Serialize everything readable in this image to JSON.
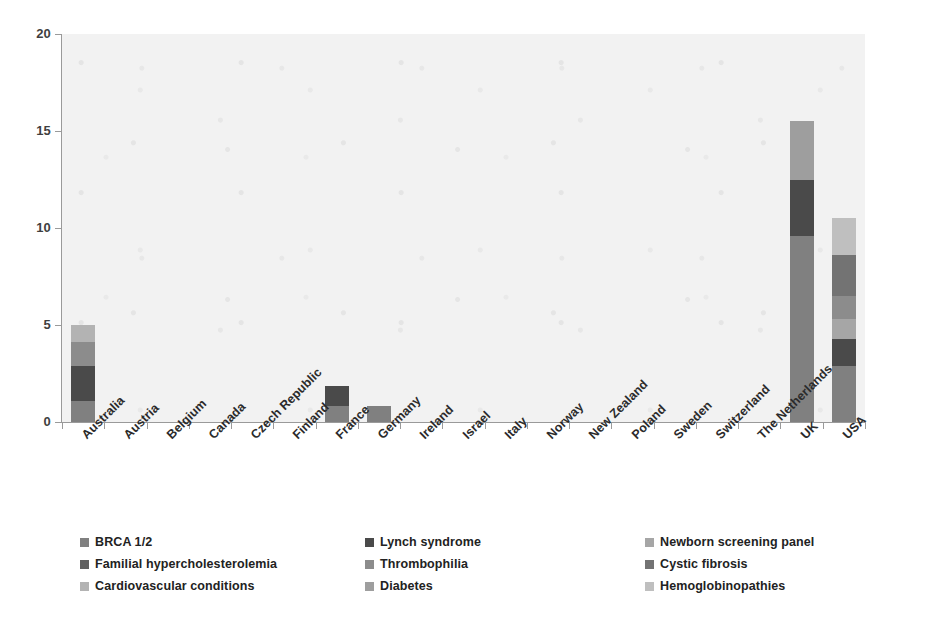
{
  "chart_data": {
    "type": "bar",
    "subtype": "stacked-column",
    "title": "",
    "xlabel": "",
    "ylabel": "",
    "ylim": [
      0,
      20
    ],
    "y_ticks": [
      0,
      5,
      10,
      15,
      20
    ],
    "grid": false,
    "legend_position": "bottom",
    "plot_background": "#f2f2f2",
    "categories": [
      "Australia",
      "Austria",
      "Belgium",
      "Canada",
      "Czech Republic",
      "Finland",
      "France",
      "Germany",
      "Ireland",
      "Israel",
      "Italy",
      "Norway",
      "New Zealand",
      "Poland",
      "Sweden",
      "Switzerland",
      "The Netherlands",
      "UK",
      "USA"
    ],
    "series": [
      {
        "name": "BRCA 1/2",
        "color": "#808080",
        "values": [
          1.1,
          0,
          0,
          0,
          0,
          0,
          0.8,
          0.85,
          0,
          0,
          0,
          0,
          0,
          0,
          0,
          0,
          0,
          9.6,
          2.9
        ]
      },
      {
        "name": "Lynch syndrome",
        "color": "#4a4a4a",
        "values": [
          1.8,
          0,
          0,
          0,
          0,
          0,
          1.05,
          0,
          0,
          0,
          0,
          0,
          0,
          0,
          0,
          0,
          0,
          2.9,
          1.4
        ]
      },
      {
        "name": "Newborn screening panel",
        "color": "#a6a6a6",
        "values": [
          0,
          0,
          0,
          0,
          0,
          0,
          0,
          0,
          0,
          0,
          0,
          0,
          0,
          0,
          0,
          0,
          0,
          0,
          1.0
        ]
      },
      {
        "name": "Familial hypercholesterolemia",
        "color": "#606060",
        "values": [
          0,
          0,
          0,
          0,
          0,
          0,
          0,
          0,
          0,
          0,
          0,
          0,
          0,
          0,
          0,
          0,
          0,
          0,
          0
        ]
      },
      {
        "name": "Thrombophilia",
        "color": "#8c8c8c",
        "values": [
          1.2,
          0,
          0,
          0,
          0,
          0,
          0,
          0,
          0,
          0,
          0,
          0,
          0,
          0,
          0,
          0,
          0,
          0,
          1.2
        ]
      },
      {
        "name": "Cystic fibrosis",
        "color": "#737373",
        "values": [
          0,
          0,
          0,
          0,
          0,
          0,
          0,
          0,
          0,
          0,
          0,
          0,
          0,
          0,
          0,
          0,
          0,
          0,
          2.1
        ]
      },
      {
        "name": "Cardiovascular conditions",
        "color": "#b3b3b3",
        "values": [
          0.9,
          0,
          0,
          0,
          0,
          0,
          0,
          0,
          0,
          0,
          0,
          0,
          0,
          0,
          0,
          0,
          0,
          0,
          0
        ]
      },
      {
        "name": "Diabetes",
        "color": "#9e9e9e",
        "values": [
          0,
          0,
          0,
          0,
          0,
          0,
          0,
          0,
          0,
          0,
          0,
          0,
          0,
          0,
          0,
          0,
          0,
          3.0,
          0
        ]
      },
      {
        "name": "Hemoglobinopathies",
        "color": "#bfbfbf",
        "values": [
          0,
          0,
          0,
          0,
          0,
          0,
          0,
          0,
          0,
          0,
          0,
          0,
          0,
          0,
          0,
          0,
          0,
          0,
          1.9
        ]
      }
    ],
    "totals": [
      5.0,
      0,
      0,
      0,
      0,
      0,
      1.85,
      0.85,
      0,
      0,
      0,
      0,
      0,
      0,
      0,
      0,
      0,
      15.5,
      10.5
    ]
  },
  "legend": {
    "items": [
      {
        "label": "BRCA 1/2",
        "color": "#808080"
      },
      {
        "label": "Lynch syndrome",
        "color": "#4a4a4a"
      },
      {
        "label": "Newborn screening panel",
        "color": "#a6a6a6"
      },
      {
        "label": "Familial hypercholesterolemia",
        "color": "#606060"
      },
      {
        "label": "Thrombophilia",
        "color": "#8c8c8c"
      },
      {
        "label": "Cystic fibrosis",
        "color": "#737373"
      },
      {
        "label": "Cardiovascular conditions",
        "color": "#b3b3b3"
      },
      {
        "label": "Diabetes",
        "color": "#9e9e9e"
      },
      {
        "label": "Hemoglobinopathies",
        "color": "#bfbfbf"
      }
    ]
  }
}
